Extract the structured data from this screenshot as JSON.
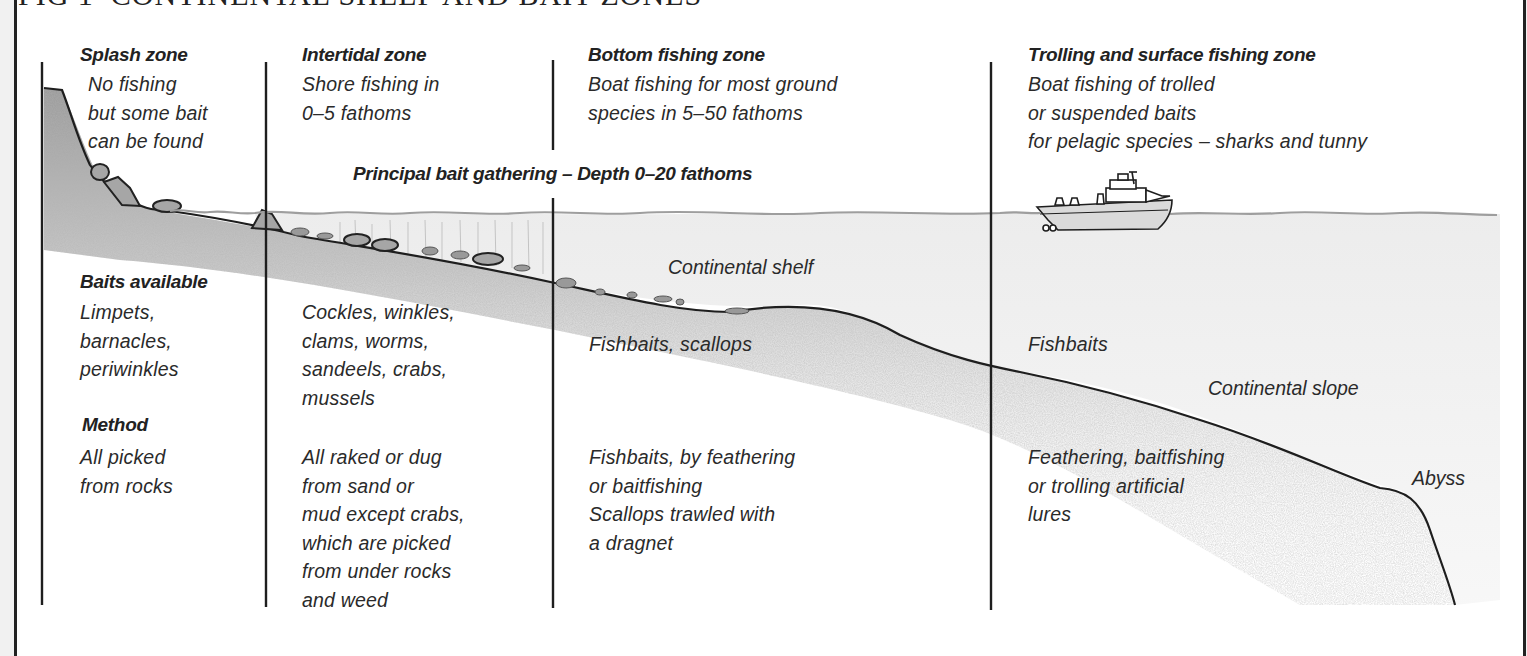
{
  "figure": {
    "title": "FIG 1  CONTINENTAL SHELF AND BAIT ZONES"
  },
  "zones": [
    {
      "name": "Splash zone",
      "description": "No fishing\nbut some bait\ncan be found"
    },
    {
      "name": "Intertidal zone",
      "description": "Shore fishing in\n0–5 fathoms"
    },
    {
      "name": "Bottom fishing zone",
      "description": "Boat fishing for most ground\nspecies in 5–50 fathoms"
    },
    {
      "name": "Trolling and surface fishing zone",
      "description": "Boat fishing of trolled\nor suspended baits\nfor pelagic species – sharks and tunny"
    }
  ],
  "banner": {
    "principal_bait": "Principal bait gathering – Depth 0–20 fathoms"
  },
  "labels": {
    "baits_available_heading": "Baits available",
    "method_heading": "Method",
    "continental_shelf": "Continental shelf",
    "continental_slope": "Continental slope",
    "abyss": "Abyss"
  },
  "baits": {
    "splash": "Limpets,\nbarnacles,\nperiwinkles",
    "intertidal": "Cockles, winkles,\nclams, worms,\nsandeels, crabs,\nmussels",
    "bottom": "Fishbaits, scallops",
    "trolling": "Fishbaits"
  },
  "methods": {
    "splash": "All picked\nfrom rocks",
    "intertidal": "All raked or dug\nfrom sand or\nmud except crabs,\nwhich are picked\nfrom under rocks\nand weed",
    "bottom": "Fishbaits, by feathering\nor baitfishing\nScallops trawled with\na dragnet",
    "trolling": "Feathering, baitfishing\nor trolling artificial\nlures"
  },
  "colors": {
    "ink": "#222222",
    "seabed_shade": "#9a9a9a",
    "water_line": "#a0a0a0",
    "water_shade": "#ececec",
    "paper": "#ffffff",
    "margin": "#f1f1f1"
  }
}
